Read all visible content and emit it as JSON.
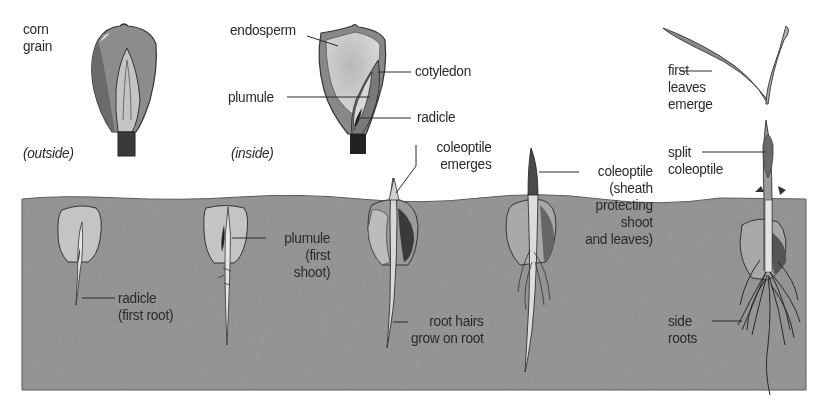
{
  "diagram": {
    "colors": {
      "background": "#ffffff",
      "soil": "#8c8c8c",
      "soil_edge": "#555555",
      "seed_light": "#c8c8c8",
      "seed_mid": "#a0a0a0",
      "seed_dark": "#3a3a3a",
      "text": "#2a2a2a",
      "leader_line": "#2a2a2a"
    },
    "grain_outside": {
      "label": "corn\ngrain",
      "caption": "(outside)"
    },
    "grain_inside": {
      "caption": "(inside)",
      "labels": {
        "endosperm": "endosperm",
        "cotyledon": "cotyledon",
        "plumule": "plumule",
        "radicle": "radicle"
      }
    },
    "stages": [
      {
        "id": "stage-1",
        "label": "radicle\n(first root)"
      },
      {
        "id": "stage-2",
        "label": "plumule\n(first\nshoot)"
      },
      {
        "id": "stage-3",
        "top_label": "coleoptile\nemerges",
        "bottom_label": "root hairs\ngrow on root"
      },
      {
        "id": "stage-4",
        "label": "coleoptile\n(sheath\nprotecting\nshoot\nand leaves)"
      },
      {
        "id": "stage-5",
        "top_label": "first\nleaves\nemerge",
        "mid_label": "split\ncoleoptile",
        "bottom_label": "side\nroots"
      }
    ]
  }
}
